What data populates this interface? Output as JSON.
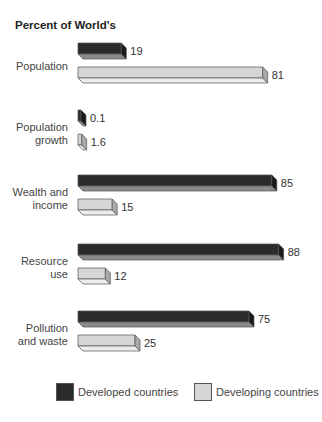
{
  "chart_data": {
    "type": "bar",
    "orientation": "horizontal",
    "style": "3d",
    "title": "Percent of World's",
    "xlabel": "",
    "ylabel": "",
    "xlim": [
      0,
      100
    ],
    "grid": false,
    "legend_position": "bottom",
    "categories": [
      "Population",
      "Population growth",
      "Wealth and income",
      "Resource use",
      "Pollution and waste"
    ],
    "category_lines": [
      [
        "Population"
      ],
      [
        "Population",
        "growth"
      ],
      [
        "Wealth and",
        "income"
      ],
      [
        "Resource",
        "use"
      ],
      [
        "Pollution",
        "and waste"
      ]
    ],
    "series": [
      {
        "name": "Developed countries",
        "values": [
          19,
          0.1,
          85,
          88,
          75
        ],
        "labels": [
          "19",
          "0.1",
          "85",
          "88",
          "75"
        ],
        "color": "#2b2b2b"
      },
      {
        "name": "Developing countries",
        "values": [
          81,
          1.6,
          15,
          12,
          25
        ],
        "labels": [
          "81",
          "1.6",
          "15",
          "12",
          "25"
        ],
        "color": "#d4d4d4"
      }
    ]
  },
  "colors": {
    "developed_front": "#2b2b2b",
    "developed_top": "#3a3a3a",
    "developed_bottom": "#8a8a8a",
    "developed_side": "#1a1a1a",
    "developing_front": "#d6d6d6",
    "developing_bottom": "#ececec",
    "developing_side": "#a9a9a9",
    "outline": "#555555"
  },
  "legend": {
    "items": [
      {
        "label": "Developed countries"
      },
      {
        "label": "Developing countries"
      }
    ]
  }
}
